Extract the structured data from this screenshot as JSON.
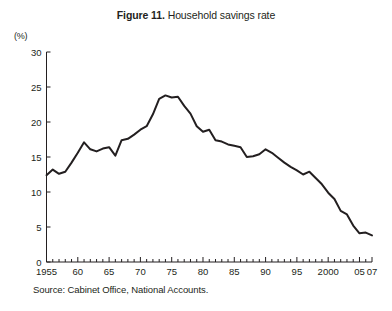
{
  "figure": {
    "label": "Figure 11.",
    "title": " Household savings rate",
    "full_title": "Figure 11. Household savings rate",
    "source_note": "Source: Cabinet Office, National Accounts.",
    "y_axis_unit": "(%)"
  },
  "chart_data": {
    "type": "line",
    "title": "Figure 11. Household savings rate",
    "xlabel": "",
    "ylabel": "(%)",
    "xlim": [
      1955,
      2007
    ],
    "ylim": [
      0,
      30
    ],
    "y_ticks": [
      0,
      5,
      10,
      15,
      20,
      25,
      30
    ],
    "y_tick_labels": [
      "0",
      "5",
      "10",
      "15",
      "20",
      "25",
      "30"
    ],
    "x_ticks": [
      1955,
      1960,
      1965,
      1970,
      1975,
      1980,
      1985,
      1990,
      1995,
      2000,
      2005,
      2007
    ],
    "x_tick_labels": [
      "1955",
      "60",
      "65",
      "70",
      "75",
      "80",
      "85",
      "90",
      "95",
      "2000",
      "05",
      "07"
    ],
    "grid": false,
    "legend": false,
    "line_color": "#231f20",
    "line_width": 2.0,
    "x": [
      1955,
      1956,
      1957,
      1958,
      1959,
      1960,
      1961,
      1962,
      1963,
      1964,
      1965,
      1966,
      1967,
      1968,
      1969,
      1970,
      1971,
      1972,
      1973,
      1974,
      1975,
      1976,
      1977,
      1978,
      1979,
      1980,
      1981,
      1982,
      1983,
      1984,
      1985,
      1986,
      1987,
      1988,
      1989,
      1990,
      1991,
      1992,
      1993,
      1994,
      1995,
      1996,
      1997,
      1998,
      1999,
      2000,
      2001,
      2002,
      2003,
      2004,
      2005,
      2006,
      2007
    ],
    "values": [
      12.4,
      13.2,
      12.6,
      12.9,
      14.2,
      15.6,
      17.1,
      16.1,
      15.8,
      16.2,
      16.4,
      15.2,
      17.4,
      17.6,
      18.2,
      18.9,
      19.4,
      21.1,
      23.3,
      23.8,
      23.5,
      23.6,
      22.3,
      21.2,
      19.4,
      18.6,
      18.9,
      17.4,
      17.2,
      16.8,
      16.6,
      16.4,
      15.0,
      15.1,
      15.4,
      16.1,
      15.6,
      14.9,
      14.2,
      13.6,
      13.1,
      12.5,
      12.9,
      12.0,
      11.1,
      9.9,
      9.0,
      7.3,
      6.8,
      5.2,
      4.1,
      4.2,
      3.8
    ]
  }
}
